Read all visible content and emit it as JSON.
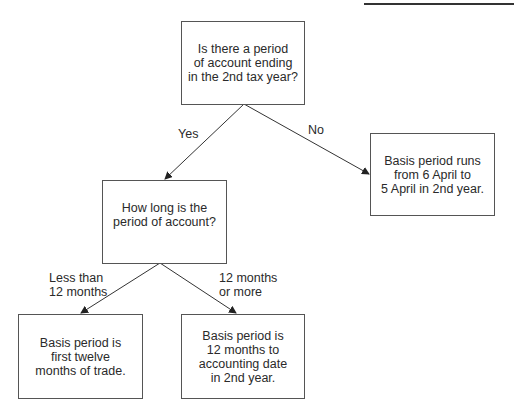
{
  "nodes": {
    "question1": "Is there a period\nof account ending\nin the 2nd tax year?",
    "outcome_no": "Basis period runs\nfrom 6 April to\n5 April in 2nd year.",
    "question2": "How long is the\nperiod of account?",
    "outcome_short": "Basis period is\nfirst twelve\nmonths of trade.",
    "outcome_long": "Basis period is\n12 months to\naccounting date\nin 2nd year."
  },
  "edges": {
    "yes": "Yes",
    "no": "No",
    "less_than": "Less than\n12 months",
    "twelve_or_more": "12 months\nor more"
  }
}
